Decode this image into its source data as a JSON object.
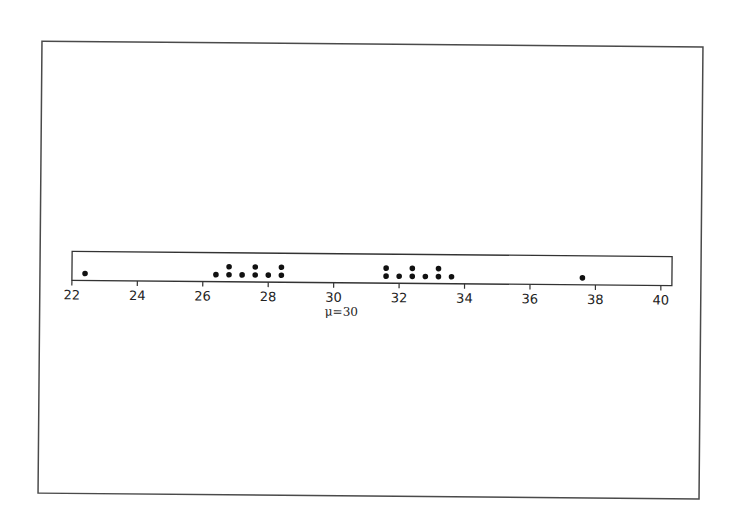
{
  "chart_data": {
    "type": "scatter",
    "subtype": "dotplot",
    "title": "",
    "xlabel": "",
    "ylabel": "",
    "xlim": [
      22,
      40
    ],
    "x_ticks": [
      22,
      24,
      26,
      28,
      30,
      32,
      34,
      36,
      38,
      40
    ],
    "annotation": "μ=30",
    "annotation_x": 30,
    "grid": false,
    "legend": null,
    "points": [
      {
        "x": 22.4,
        "count": 1
      },
      {
        "x": 26.4,
        "count": 1
      },
      {
        "x": 26.8,
        "count": 2
      },
      {
        "x": 27.2,
        "count": 1
      },
      {
        "x": 27.6,
        "count": 2
      },
      {
        "x": 28.0,
        "count": 1
      },
      {
        "x": 28.4,
        "count": 2
      },
      {
        "x": 31.6,
        "count": 2
      },
      {
        "x": 32.0,
        "count": 1
      },
      {
        "x": 32.4,
        "count": 2
      },
      {
        "x": 32.8,
        "count": 1
      },
      {
        "x": 33.2,
        "count": 2
      },
      {
        "x": 33.6,
        "count": 1
      },
      {
        "x": 37.6,
        "count": 1
      }
    ],
    "values": [
      22.4,
      26.4,
      26.8,
      26.8,
      27.2,
      27.6,
      27.6,
      28.0,
      28.4,
      28.4,
      31.6,
      31.6,
      32.0,
      32.4,
      32.4,
      32.8,
      33.2,
      33.2,
      33.6,
      37.6
    ]
  }
}
